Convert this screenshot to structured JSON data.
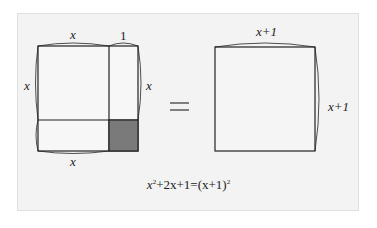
{
  "left_figure": {
    "top_label_x": "x",
    "top_label_1": "1",
    "left_label": "x",
    "right_label": "x",
    "bottom_label": "x",
    "shaded_color": "#7a7a7a"
  },
  "operator": "=",
  "right_figure": {
    "top_label": "x+1",
    "right_label": "x+1"
  },
  "equation": {
    "lhs_var": "x",
    "lhs_exp": "2",
    "lhs_rest": "+2x+1=(x+1)",
    "rhs_exp": "2"
  }
}
